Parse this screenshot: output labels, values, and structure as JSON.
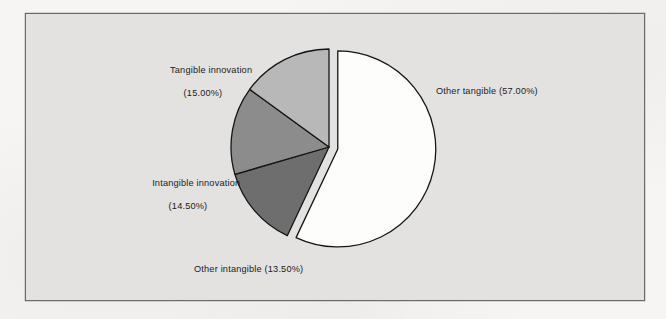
{
  "figure": {
    "frame_border_color": "#6a6a6a",
    "panel_background": "#e3e2e0",
    "page_background": "#f6f5f3",
    "outline_color": "#151515"
  },
  "chart_data": {
    "type": "pie",
    "title": "",
    "subtitle": "",
    "xlabel": "",
    "ylabel": "",
    "legend_position": "none",
    "grid": false,
    "labels_inline": true,
    "start_angle_deg": 0,
    "direction": "clockwise",
    "categories": [
      "Other tangible",
      "Other intangible",
      "Intangible innovation",
      "Tangible innovation"
    ],
    "values": [
      57.0,
      13.5,
      14.5,
      15.0
    ],
    "units": "percent",
    "total": 100.0,
    "slices": [
      {
        "name": "Other tangible",
        "value": 57.0,
        "value_text": "57.00%",
        "label_text": "Other tangible (57.00%)",
        "label_lines": [
          "Other tangible (57.00%)"
        ],
        "fill": "#fdfdfb",
        "exploded": true,
        "explode_offset_px": 9
      },
      {
        "name": "Other intangible",
        "value": 13.5,
        "value_text": "13.50%",
        "label_text": "Other intangible (13.50%)",
        "label_lines": [
          "Other intangible (13.50%)"
        ],
        "fill": "#6e6e6e",
        "exploded": false,
        "explode_offset_px": 0
      },
      {
        "name": "Intangible innovation",
        "value": 14.5,
        "value_text": "14.50%",
        "label_text": "Intangible innovation (14.50%)",
        "label_lines": [
          "Intangible innovation",
          "(14.50%)"
        ],
        "fill": "#8c8c8c",
        "exploded": false,
        "explode_offset_px": 0
      },
      {
        "name": "Tangible innovation",
        "value": 15.0,
        "value_text": "15.00%",
        "label_text": "Tangible innovation (15.00%)",
        "label_lines": [
          "Tangible innovation",
          "(15.00%)"
        ],
        "fill": "#b8b8b8",
        "exploded": false,
        "explode_offset_px": 0
      }
    ],
    "geometry": {
      "center_x": 303,
      "center_y": 133,
      "radius": 98
    }
  },
  "labels": {
    "tangible_innovation_line1": "Tangible innovation",
    "tangible_innovation_line2": "(15.00%)",
    "intangible_innovation_line1": "Intangible innovation",
    "intangible_innovation_line2": "(14.50%)",
    "other_intangible": "Other intangible (13.50%)",
    "other_tangible": "Other tangible (57.00%)"
  }
}
